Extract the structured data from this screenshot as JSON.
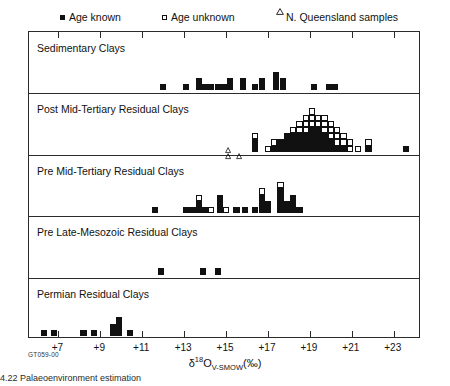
{
  "legend": {
    "items": [
      {
        "label": "Age known",
        "marker": "filled-square",
        "x": 60
      },
      {
        "label": "Age unknown",
        "marker": "open-square",
        "x": 162
      },
      {
        "label": "N. Queensland samples",
        "marker": "open-triangle",
        "x": 276
      }
    ]
  },
  "axis": {
    "label_delta": "δ",
    "label_sup": "18",
    "label_O": "O",
    "label_sub": "V-SMOW",
    "label_unit": "(‰)",
    "ticks": [
      "+7",
      "+9",
      "+11",
      "+13",
      "+15",
      "+17",
      "+19",
      "+21",
      "+23"
    ],
    "tick_values": [
      7,
      9,
      11,
      13,
      15,
      17,
      19,
      21,
      23
    ],
    "xlim": [
      5.6,
      24.3
    ]
  },
  "figure_id": "GT059-00",
  "caption": "4.22   Palaeoenvironment estimation",
  "rows": [
    {
      "label": "Sedimentary Clays"
    },
    {
      "label": "Post Mid-Tertiary Residual Clays"
    },
    {
      "label": "Pre Mid-Tertiary Residual Clays"
    },
    {
      "label": "Pre Late-Mesozoic Residual Clays"
    },
    {
      "label": "Permian Residual Clays"
    }
  ],
  "chart_data": {
    "type": "scatter",
    "title": "",
    "xlabel": "δ18O V-SMOW (‰)",
    "ylabel": "Clay type",
    "xlim": [
      5.6,
      24.3
    ],
    "grid": false,
    "legend_position": "top",
    "note": "Stacked-square histogram: each square is one sample. 'filled' = age known, 'open' = age unknown, 'triangle' = N. Queensland samples. 'count' is total squares in the column; 'open' is how many of the topmost squares are open; 'tri' is number of triangles.",
    "series": [
      {
        "name": "Sedimentary Clays",
        "row": 0,
        "columns": [
          {
            "x": 12.0,
            "count": 1,
            "open": 0,
            "tri": 0
          },
          {
            "x": 13.1,
            "count": 1,
            "open": 0,
            "tri": 0
          },
          {
            "x": 13.7,
            "count": 2,
            "open": 0,
            "tri": 0
          },
          {
            "x": 14.0,
            "count": 1,
            "open": 0,
            "tri": 0
          },
          {
            "x": 14.3,
            "count": 1,
            "open": 0,
            "tri": 0
          },
          {
            "x": 14.6,
            "count": 1,
            "open": 0,
            "tri": 0
          },
          {
            "x": 14.9,
            "count": 1,
            "open": 0,
            "tri": 0
          },
          {
            "x": 15.2,
            "count": 2,
            "open": 0,
            "tri": 0
          },
          {
            "x": 15.8,
            "count": 2,
            "open": 0,
            "tri": 0
          },
          {
            "x": 16.4,
            "count": 1,
            "open": 0,
            "tri": 0
          },
          {
            "x": 16.7,
            "count": 2,
            "open": 0,
            "tri": 0
          },
          {
            "x": 17.4,
            "count": 3,
            "open": 0,
            "tri": 0
          },
          {
            "x": 17.7,
            "count": 2,
            "open": 0,
            "tri": 0
          },
          {
            "x": 19.2,
            "count": 1,
            "open": 0,
            "tri": 0
          },
          {
            "x": 19.9,
            "count": 1,
            "open": 0,
            "tri": 0
          },
          {
            "x": 20.2,
            "count": 1,
            "open": 0,
            "tri": 0
          }
        ]
      },
      {
        "name": "Post Mid-Tertiary Residual Clays",
        "row": 1,
        "columns": [
          {
            "x": 15.1,
            "count": 0,
            "open": 0,
            "tri": 2
          },
          {
            "x": 15.6,
            "count": 0,
            "open": 0,
            "tri": 1
          },
          {
            "x": 16.4,
            "count": 3,
            "open": 1,
            "tri": 0
          },
          {
            "x": 17.0,
            "count": 1,
            "open": 1,
            "tri": 0
          },
          {
            "x": 17.3,
            "count": 2,
            "open": 1,
            "tri": 0
          },
          {
            "x": 17.6,
            "count": 2,
            "open": 0,
            "tri": 0
          },
          {
            "x": 17.9,
            "count": 3,
            "open": 0,
            "tri": 0
          },
          {
            "x": 18.2,
            "count": 4,
            "open": 1,
            "tri": 0
          },
          {
            "x": 18.5,
            "count": 5,
            "open": 2,
            "tri": 0
          },
          {
            "x": 18.8,
            "count": 6,
            "open": 3,
            "tri": 0
          },
          {
            "x": 19.1,
            "count": 7,
            "open": 3,
            "tri": 0
          },
          {
            "x": 19.4,
            "count": 6,
            "open": 2,
            "tri": 0
          },
          {
            "x": 19.7,
            "count": 6,
            "open": 3,
            "tri": 0
          },
          {
            "x": 20.0,
            "count": 5,
            "open": 3,
            "tri": 0
          },
          {
            "x": 20.3,
            "count": 4,
            "open": 3,
            "tri": 0
          },
          {
            "x": 20.6,
            "count": 3,
            "open": 2,
            "tri": 0
          },
          {
            "x": 20.9,
            "count": 2,
            "open": 2,
            "tri": 0
          },
          {
            "x": 21.3,
            "count": 1,
            "open": 1,
            "tri": 0
          },
          {
            "x": 21.8,
            "count": 2,
            "open": 1,
            "tri": 0
          },
          {
            "x": 23.6,
            "count": 1,
            "open": 0,
            "tri": 0
          }
        ]
      },
      {
        "name": "Pre Mid-Tertiary Residual Clays",
        "row": 2,
        "columns": [
          {
            "x": 11.6,
            "count": 1,
            "open": 0,
            "tri": 0
          },
          {
            "x": 13.1,
            "count": 1,
            "open": 0,
            "tri": 0
          },
          {
            "x": 13.4,
            "count": 1,
            "open": 0,
            "tri": 0
          },
          {
            "x": 13.7,
            "count": 3,
            "open": 1,
            "tri": 0
          },
          {
            "x": 14.0,
            "count": 1,
            "open": 0,
            "tri": 0
          },
          {
            "x": 14.3,
            "count": 1,
            "open": 1,
            "tri": 0
          },
          {
            "x": 14.7,
            "count": 3,
            "open": 0,
            "tri": 0
          },
          {
            "x": 15.0,
            "count": 1,
            "open": 1,
            "tri": 0
          },
          {
            "x": 15.5,
            "count": 1,
            "open": 0,
            "tri": 0
          },
          {
            "x": 15.9,
            "count": 1,
            "open": 0,
            "tri": 0
          },
          {
            "x": 16.4,
            "count": 1,
            "open": 0,
            "tri": 0
          },
          {
            "x": 16.7,
            "count": 4,
            "open": 1,
            "tri": 0
          },
          {
            "x": 17.0,
            "count": 2,
            "open": 0,
            "tri": 0
          },
          {
            "x": 17.6,
            "count": 5,
            "open": 1,
            "tri": 0
          },
          {
            "x": 17.9,
            "count": 2,
            "open": 0,
            "tri": 0
          },
          {
            "x": 18.2,
            "count": 3,
            "open": 0,
            "tri": 0
          },
          {
            "x": 18.5,
            "count": 1,
            "open": 0,
            "tri": 0
          }
        ]
      },
      {
        "name": "Pre Late-Mesozoic Residual Clays",
        "row": 3,
        "columns": [
          {
            "x": 11.9,
            "count": 1,
            "open": 0,
            "tri": 0
          },
          {
            "x": 13.9,
            "count": 1,
            "open": 0,
            "tri": 0
          },
          {
            "x": 14.6,
            "count": 1,
            "open": 0,
            "tri": 0
          }
        ]
      },
      {
        "name": "Permian Residual Clays",
        "row": 4,
        "columns": [
          {
            "x": 6.3,
            "count": 1,
            "open": 0,
            "tri": 0
          },
          {
            "x": 6.8,
            "count": 1,
            "open": 0,
            "tri": 0
          },
          {
            "x": 8.2,
            "count": 1,
            "open": 0,
            "tri": 0
          },
          {
            "x": 8.7,
            "count": 1,
            "open": 0,
            "tri": 0
          },
          {
            "x": 9.6,
            "count": 2,
            "open": 0,
            "tri": 0
          },
          {
            "x": 9.9,
            "count": 3,
            "open": 0,
            "tri": 0
          },
          {
            "x": 10.4,
            "count": 1,
            "open": 0,
            "tri": 0
          }
        ]
      }
    ]
  }
}
